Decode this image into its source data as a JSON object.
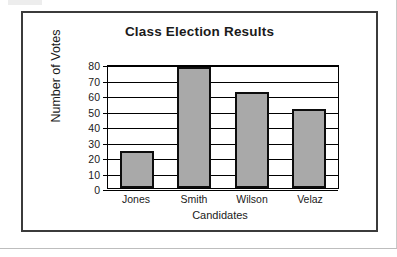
{
  "figure": {
    "frame_border_color": "#3b3b3b",
    "background_color": "#ffffff"
  },
  "chart_data": {
    "type": "bar",
    "title": "Class Election Results",
    "xlabel": "Candidates",
    "ylabel": "Number of Votes",
    "categories": [
      "Jones",
      "Smith",
      "Wilson",
      "Velaz"
    ],
    "values": [
      24,
      78,
      62,
      51
    ],
    "ylim": [
      0,
      80
    ],
    "ytick_labels": [
      "80",
      "70",
      "60",
      "50",
      "40",
      "30",
      "20",
      "10",
      "0"
    ],
    "ytick_values": [
      80,
      70,
      60,
      50,
      40,
      30,
      20,
      10,
      0
    ],
    "ytick_step": 10,
    "grid": true,
    "grid_axis": "y",
    "grid_color": "#000000",
    "legend": false,
    "bar_fill_color": "#a9a9a9",
    "bar_edge_color": "#0d0d0d",
    "axis_color": "#000000",
    "series": [
      {
        "name": "Number of Votes",
        "values": [
          24,
          78,
          62,
          51
        ]
      }
    ]
  }
}
